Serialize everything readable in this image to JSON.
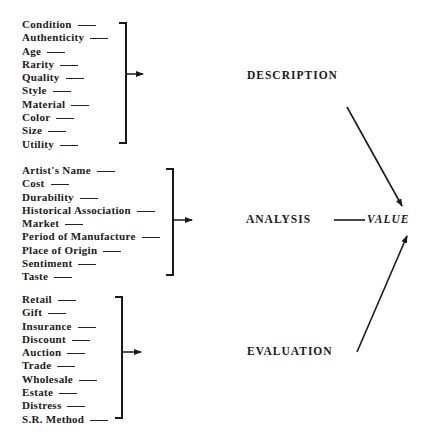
{
  "groups": [
    {
      "name": "description-factors",
      "items": [
        "Condition",
        "Authenticity",
        "Age",
        "Rarity",
        "Quality",
        "Style",
        "Material",
        "Color",
        "Size",
        "Utility"
      ]
    },
    {
      "name": "analysis-factors",
      "items": [
        "Artist's Name",
        "Cost",
        "Durability",
        "Historical Association",
        "Market",
        "Period of Manufacture",
        "Place of Origin",
        "Sentiment",
        "Taste"
      ]
    },
    {
      "name": "evaluation-factors",
      "items": [
        "Retail",
        "Gift",
        "Insurance",
        "Discount",
        "Auction",
        "Trade",
        "Wholesale",
        "Estate",
        "Distress",
        "S.R. Method"
      ]
    }
  ],
  "stages": {
    "description": "DESCRIPTION",
    "analysis": "ANALYSIS",
    "evaluation": "EVALUATION",
    "value": "VALUE"
  }
}
